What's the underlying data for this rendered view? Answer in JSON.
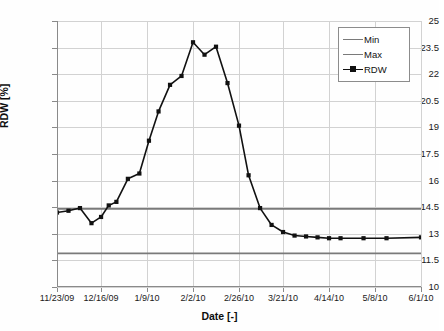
{
  "chart_data": {
    "type": "line",
    "title": "",
    "xlabel": "Date [-]",
    "ylabel": "RDW [%]",
    "ylim": [
      10,
      25
    ],
    "yticks": [
      "10",
      "11.5",
      "13",
      "14.5",
      "16",
      "17.5",
      "19",
      "20.5",
      "22",
      "23.5",
      "25"
    ],
    "ytick_values": [
      10,
      11.5,
      13,
      14.5,
      16,
      17.5,
      19,
      20.5,
      22,
      23.5,
      25
    ],
    "xticks": [
      "11/23/09",
      "12/16/09",
      "1/9/10",
      "2/2/10",
      "2/26/10",
      "3/21/10",
      "4/14/10",
      "5/8/10",
      "6/1/10"
    ],
    "xtick_days": [
      0,
      23,
      47,
      71,
      95,
      118,
      142,
      166,
      190
    ],
    "xlim_days": [
      0,
      190
    ],
    "grid": true,
    "legend_position": "top-right",
    "series": [
      {
        "name": "Min",
        "type": "hline",
        "color": "#7a7a7a",
        "value": 11.9
      },
      {
        "name": "Max",
        "type": "hline",
        "color": "#7a7a7a",
        "value": 14.4
      },
      {
        "name": "RDW",
        "type": "line-markers",
        "color": "#111111",
        "x_days": [
          0,
          6,
          12,
          18,
          23,
          27,
          31,
          37,
          43,
          48,
          53,
          59,
          65,
          71,
          77,
          83,
          89,
          95,
          100,
          106,
          112,
          118,
          124,
          130,
          136,
          142,
          148,
          160,
          172,
          190
        ],
        "values": [
          14.2,
          14.3,
          14.45,
          13.6,
          13.95,
          14.6,
          14.8,
          16.1,
          16.4,
          18.25,
          19.9,
          21.4,
          21.9,
          23.8,
          23.1,
          23.55,
          21.5,
          19.1,
          16.3,
          14.45,
          13.5,
          13.1,
          12.9,
          12.85,
          12.8,
          12.75,
          12.75,
          12.75,
          12.75,
          12.8
        ]
      }
    ]
  },
  "legend": {
    "entries": [
      {
        "label": "Min"
      },
      {
        "label": "Max"
      },
      {
        "label": "RDW"
      }
    ]
  }
}
